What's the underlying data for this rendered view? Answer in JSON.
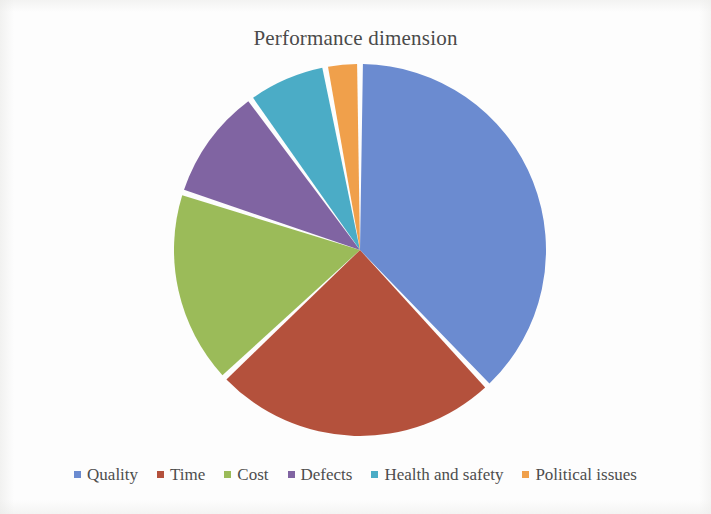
{
  "chart": {
    "title": "Performance dimension"
  },
  "chart_data": {
    "type": "pie",
    "title": "Performance dimension",
    "xlabel": "",
    "ylabel": "",
    "legend_position": "bottom",
    "grid": false,
    "categories": [
      "Quality",
      "Time",
      "Cost",
      "Defects",
      "Health and safety",
      "Political issues"
    ],
    "values": [
      38,
      25,
      17,
      10,
      7,
      3
    ],
    "unit": "%",
    "start_angle_deg": 0,
    "direction": "clockwise",
    "slice_angles_deg": [
      136.8,
      90.0,
      61.2,
      36.0,
      25.2,
      10.8
    ],
    "colors": [
      "#6b8bd0",
      "#b4513c",
      "#9bbb59",
      "#8064a2",
      "#4bacc6",
      "#f0a04b"
    ],
    "slices": [
      {
        "label": "Quality",
        "value": 38,
        "color": "#6b8bd0",
        "angle_deg": 136.8
      },
      {
        "label": "Time",
        "value": 25,
        "color": "#b4513c",
        "angle_deg": 90.0
      },
      {
        "label": "Cost",
        "value": 17,
        "color": "#9bbb59",
        "angle_deg": 61.2
      },
      {
        "label": "Defects",
        "value": 10,
        "color": "#8064a2",
        "angle_deg": 36.0
      },
      {
        "label": "Health and safety",
        "value": 7,
        "color": "#4bacc6",
        "angle_deg": 25.2
      },
      {
        "label": "Political issues",
        "value": 3,
        "color": "#f0a04b",
        "angle_deg": 10.8
      }
    ]
  },
  "legend": {
    "items": [
      {
        "label": "Quality",
        "color": "#6b8bd0"
      },
      {
        "label": "Time",
        "color": "#b4513c"
      },
      {
        "label": "Cost",
        "color": "#9bbb59"
      },
      {
        "label": "Defects",
        "color": "#8064a2"
      },
      {
        "label": "Health and safety",
        "color": "#4bacc6"
      },
      {
        "label": "Political issues",
        "color": "#f0a04b"
      }
    ]
  }
}
